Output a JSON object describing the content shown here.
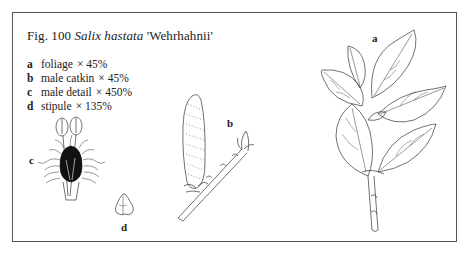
{
  "figure": {
    "number_label": "Fig. 100",
    "species": "Salix hastata",
    "cultivar": "'Wehrhahnii'",
    "legend": [
      {
        "key": "a",
        "description": "foliage",
        "scale": "× 45%"
      },
      {
        "key": "b",
        "description": "male catkin",
        "scale": "× 45%"
      },
      {
        "key": "c",
        "description": "male detail",
        "scale": "× 450%"
      },
      {
        "key": "d",
        "description": "stipule",
        "scale": "× 135%"
      }
    ],
    "panel_labels": {
      "a": "a",
      "b": "b",
      "c": "c",
      "d": "d"
    },
    "illustrations": [
      {
        "id": "a",
        "subject": "foliage-branch-icon"
      },
      {
        "id": "b",
        "subject": "male-catkin-icon"
      },
      {
        "id": "c",
        "subject": "male-flower-detail-icon"
      },
      {
        "id": "d",
        "subject": "stipule-icon"
      }
    ]
  }
}
